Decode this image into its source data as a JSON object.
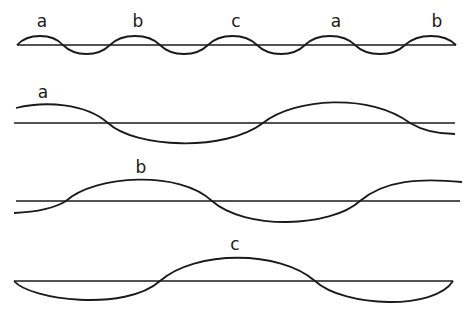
{
  "diagram": {
    "type": "wave-decomposition",
    "rows": [
      {
        "id": "combined",
        "labels": [
          "a",
          "b",
          "c",
          "a",
          "b"
        ],
        "description": "Short-period wave with repeating crests labelled a, b, c, a, b"
      },
      {
        "id": "wave-a",
        "labels": [
          "a"
        ],
        "description": "Long-period wave, crest a at start"
      },
      {
        "id": "wave-b",
        "labels": [
          "b"
        ],
        "description": "Long-period wave, crest b"
      },
      {
        "id": "wave-c",
        "labels": [
          "c"
        ],
        "description": "Long-period wave, crest c in centre"
      }
    ],
    "colors": {
      "stroke": "#1a1a1a",
      "background": "#ffffff"
    }
  },
  "labels": {
    "row1": [
      "a",
      "b",
      "c",
      "a",
      "b"
    ],
    "row2": "a",
    "row3": "b",
    "row4": "c"
  }
}
